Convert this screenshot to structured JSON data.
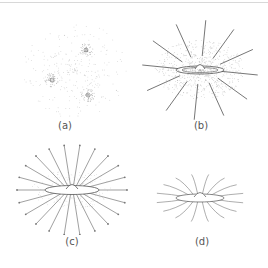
{
  "figure": {
    "panels": [
      {
        "id": "a",
        "label": "(a)",
        "description": "diffuse cloud with three condensing cores"
      },
      {
        "id": "b",
        "label": "(b)",
        "description": "collapsing disk with dense halo and radial field lines"
      },
      {
        "id": "c",
        "label": "(c)",
        "description": "disk with radial lines and arrows"
      },
      {
        "id": "d",
        "label": "(d)",
        "description": "disk with curved field lines"
      }
    ]
  },
  "colors": {
    "ink": "#777777",
    "dots": "#9a9a9a",
    "background": "#ffffff"
  }
}
